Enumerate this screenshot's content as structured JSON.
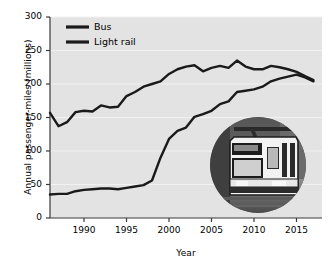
{
  "chart_data": {
    "type": "line",
    "title": "",
    "xlabel": "Year",
    "ylabel": "Annual passenger-miles (millions)",
    "xlim": [
      1986,
      2018
    ],
    "ylim": [
      0,
      300
    ],
    "xticks": [
      1990,
      1995,
      2000,
      2005,
      2010,
      2015
    ],
    "yticks": [
      0,
      50,
      100,
      150,
      200,
      250,
      300
    ],
    "xtick_labels": [
      "1990",
      "1995",
      "2000",
      "2005",
      "2010",
      "2015"
    ],
    "ytick_labels": [
      "0",
      "50",
      "100",
      "150",
      "200",
      "250",
      "300"
    ],
    "grid": "horizontal-white",
    "legend_position": "top-left",
    "legend_entries": [
      "Bus",
      "Light rail"
    ],
    "x": [
      1986,
      1987,
      1988,
      1989,
      1990,
      1991,
      1992,
      1993,
      1994,
      1995,
      1996,
      1997,
      1998,
      1999,
      2000,
      2001,
      2002,
      2003,
      2004,
      2005,
      2006,
      2007,
      2008,
      2009,
      2010,
      2011,
      2012,
      2013,
      2014,
      2015,
      2016,
      2017
    ],
    "series": [
      {
        "name": "Bus",
        "color": "#1a1a1a",
        "values": [
          157,
          137,
          143,
          158,
          160,
          159,
          168,
          165,
          166,
          182,
          188,
          196,
          200,
          204,
          215,
          222,
          226,
          228,
          219,
          224,
          227,
          224,
          235,
          226,
          222,
          222,
          227,
          225,
          222,
          218,
          212,
          206
        ]
      },
      {
        "name": "Light rail",
        "color": "#1a1a1a",
        "values": [
          35,
          36,
          36,
          40,
          42,
          43,
          44,
          44,
          43,
          45,
          47,
          49,
          56,
          90,
          118,
          130,
          135,
          151,
          155,
          160,
          170,
          174,
          188,
          190,
          192,
          196,
          204,
          208,
          211,
          214,
          210,
          204
        ]
      }
    ],
    "annotations": [
      {
        "name": "light-rail-photo",
        "description": "circular photograph of a light rail train"
      }
    ]
  },
  "axes": {
    "ylabel": "Annual passenger-miles (millions)",
    "xlabel": "Year"
  },
  "legend": {
    "items": [
      {
        "label": "Bus"
      },
      {
        "label": "Light rail"
      }
    ]
  },
  "colors": {
    "plot_background": "#e3e3e3",
    "line": "#1a1a1a",
    "gridline": "#f2f2f2",
    "axis": "#3a3a3a",
    "text": "#000000"
  }
}
